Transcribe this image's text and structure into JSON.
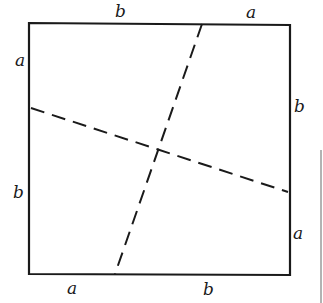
{
  "diagram": {
    "square": {
      "x1": 29,
      "y1": 23,
      "x2": 290,
      "y2": 275
    },
    "dashed_lines": [
      {
        "name": "steep-cut",
        "x1": 202,
        "y1": 23,
        "x2": 115,
        "y2": 275
      },
      {
        "name": "shallow-cut",
        "x1": 30,
        "y1": 108,
        "x2": 289,
        "y2": 192
      }
    ],
    "labels": {
      "top_left": "b",
      "top_right": "a",
      "left_top": "a",
      "left_bottom": "b",
      "right_top": "b",
      "right_bottom": "a",
      "bottom_left": "a",
      "bottom_right": "b"
    },
    "colors": {
      "stroke": "#1a1a1a",
      "background": "#ffffff",
      "edge": "#9a9a9a"
    }
  }
}
